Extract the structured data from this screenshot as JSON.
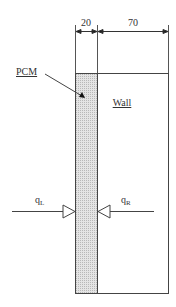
{
  "diagram": {
    "dimensions": [
      {
        "label": "20",
        "from_x": 75,
        "to_x": 97
      },
      {
        "label": "70",
        "from_x": 97,
        "to_x": 168
      }
    ],
    "labels": {
      "pcm": "PCM",
      "wall": "Wall",
      "q_left": "q",
      "q_left_sub": "L",
      "q_right": "q",
      "q_right_sub": "R"
    },
    "colors": {
      "line": "#444444",
      "pcm_fill": "#d9d9d9",
      "background": "#ffffff"
    }
  }
}
